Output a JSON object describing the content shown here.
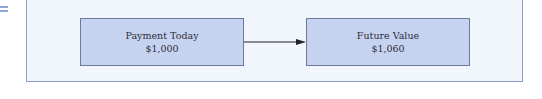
{
  "diagram": {
    "nodes": [
      {
        "title": "Payment Today",
        "value": "$1,000"
      },
      {
        "title": "Future Value",
        "value": "$1,060"
      }
    ],
    "edges": [
      {
        "from": 0,
        "to": 1,
        "type": "arrow"
      }
    ],
    "colors": {
      "frame_fill": "#f1f6fd",
      "frame_border": "#8a9bd0",
      "node_fill": "#c6d3f0",
      "node_border": "#6c78a0",
      "arrow": "#222222"
    }
  }
}
